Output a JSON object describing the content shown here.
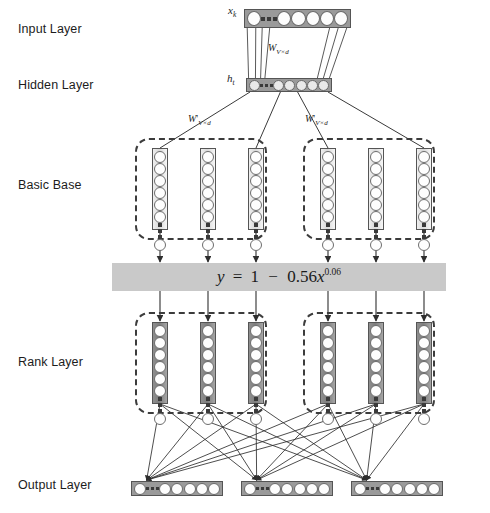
{
  "figure": {
    "type": "neural-network-architecture-diagram",
    "background": "#ffffff"
  },
  "row_labels": [
    {
      "key": "input",
      "label": "Input Layer",
      "x": 18,
      "y": 22
    },
    {
      "key": "hidden",
      "label": "Hidden Layer",
      "x": 18,
      "y": 78
    },
    {
      "key": "base",
      "label": "Basic Base",
      "x": 18,
      "y": 178
    },
    {
      "key": "rank",
      "label": "Rank Layer",
      "x": 18,
      "y": 355
    },
    {
      "key": "output",
      "label": "Output Layer",
      "x": 18,
      "y": 478
    }
  ],
  "input_layer": {
    "name": "x_k",
    "label_main": "x",
    "label_sub": "k",
    "label_x": 228,
    "label_y": 8,
    "bar": {
      "x": 244,
      "y": 9,
      "w": 107,
      "h": 19
    },
    "leading_circles": 1,
    "trailing_circles": 5,
    "ellipsis_dots": 3,
    "circle_size": 13,
    "fill": "#9a9a9a",
    "circle_fill": "#fdfdfd"
  },
  "hidden_layer": {
    "name": "h_t",
    "label_main": "h",
    "label_sub": "t",
    "label_x": 227,
    "label_y": 76,
    "bar": {
      "x": 246,
      "y": 78,
      "w": 86,
      "h": 14
    },
    "leading_circles": 1,
    "trailing_circles": 5,
    "ellipsis_dots": 3,
    "circle_size": 9,
    "fill": "#9a9a9a",
    "circle_fill": "#e9e9e9"
  },
  "weights": [
    {
      "key": "w-in-hidden",
      "main": "W",
      "prime": "",
      "sub": "V×d",
      "x": 268,
      "y": 42
    },
    {
      "key": "w-hidden-left",
      "main": "W",
      "prime": "'",
      "sub": "V×d",
      "x": 188,
      "y": 113
    },
    {
      "key": "w-hidden-right",
      "main": "W",
      "prime": "'",
      "sub": "V×d",
      "x": 305,
      "y": 113
    }
  ],
  "basic_base": {
    "title": "Basic Base",
    "column_count": 6,
    "columns_x": [
      152,
      200,
      248,
      320,
      368,
      416
    ],
    "col_y": 148,
    "col_w": 16,
    "col_h": 82,
    "circles_before_ellipsis": 6,
    "circles_after_ellipsis": 1,
    "ellipsis_dots": 3,
    "circle_size": 10,
    "groups": [
      {
        "key": "base-group-left",
        "x": 135,
        "y": 138,
        "w": 132,
        "h": 102
      },
      {
        "key": "base-group-right",
        "x": 303,
        "y": 138,
        "w": 132,
        "h": 102
      }
    ]
  },
  "equation_bar": {
    "text_plain": "y = 1 − 0.56x^0.06",
    "lhs": "y",
    "eq": "=",
    "const": "1",
    "minus": "−",
    "coef": "0.56",
    "var": "x",
    "exponent": "0.06",
    "x": 112,
    "y": 263,
    "w": 334,
    "h": 28,
    "fill": "#c9c9c9",
    "arrows_in": 6,
    "arrows_out": 6
  },
  "rank_layer": {
    "title": "Rank Layer",
    "column_count": 6,
    "columns_x": [
      152,
      200,
      248,
      320,
      368,
      416
    ],
    "col_y": 322,
    "col_w": 16,
    "col_h": 82,
    "circles_before_ellipsis": 6,
    "circles_after_ellipsis": 1,
    "ellipsis_dots": 3,
    "circle_size": 10,
    "groups": [
      {
        "key": "rank-group-left",
        "x": 135,
        "y": 312,
        "w": 132,
        "h": 102
      },
      {
        "key": "rank-group-right",
        "x": 303,
        "y": 312,
        "w": 132,
        "h": 102
      }
    ]
  },
  "output_layer": {
    "title": "Output Layer",
    "bar_count": 3,
    "bars": [
      {
        "key": "output-bar-1",
        "x": 131,
        "y": 481,
        "w": 92,
        "h": 15
      },
      {
        "key": "output-bar-2",
        "x": 241,
        "y": 481,
        "w": 92,
        "h": 15
      },
      {
        "key": "output-bar-3",
        "x": 351,
        "y": 481,
        "w": 92,
        "h": 15
      }
    ],
    "leading_circles": 1,
    "trailing_circles": 5,
    "ellipsis_dots": 3,
    "circle_size": 10,
    "fill": "#9a9a9a",
    "circle_fill": "#fdfdfd"
  },
  "colors": {
    "bar_gray": "#9a9a9a",
    "equation_gray": "#c9c9c9",
    "rank_column_gray": "#7d7d7d",
    "base_column_gray": "#d8d8d8",
    "stroke": "#3c3c3c",
    "text": "#1a1a1a"
  }
}
